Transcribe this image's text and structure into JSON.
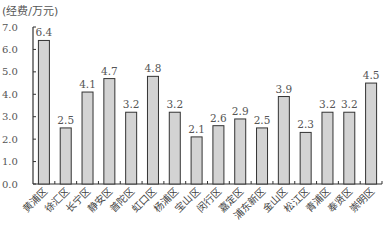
{
  "chart_data": {
    "type": "bar",
    "title": "",
    "ylabel": "(经费/万元)",
    "xlabel": "",
    "ylim": [
      0,
      7
    ],
    "yticks": [
      "0.0",
      "1.0",
      "2.0",
      "3.0",
      "4.0",
      "5.0",
      "6.0",
      "7.0"
    ],
    "grid": false,
    "legend": null,
    "categories": [
      "黄浦区",
      "徐汇区",
      "长宁区",
      "静安区",
      "普陀区",
      "虹口区",
      "杨浦区",
      "宝山区",
      "闵行区",
      "嘉定区",
      "浦东新区",
      "金山区",
      "松江区",
      "青浦区",
      "奉贤区",
      "崇明区"
    ],
    "values": [
      6.4,
      2.5,
      4.1,
      4.7,
      3.2,
      4.8,
      3.2,
      2.1,
      2.6,
      2.9,
      2.5,
      3.9,
      2.3,
      3.2,
      3.2,
      4.5
    ],
    "value_labels": [
      "6.4",
      "2.5",
      "4.1",
      "4.7",
      "3.2",
      "4.8",
      "3.2",
      "2.1",
      "2.6",
      "2.9",
      "2.5",
      "3.9",
      "2.3",
      "3.2",
      "3.2",
      "4.5"
    ],
    "colors": {
      "bar_fill": "#d3d3d3",
      "bar_stroke": "#333333",
      "axis": "#333333"
    }
  }
}
